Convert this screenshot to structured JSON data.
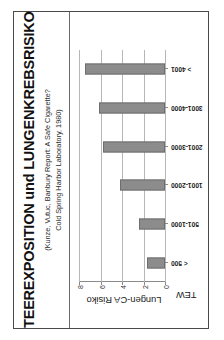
{
  "slide": {
    "title": "TEEREXPOSITION und LUNGENKREBSRISIKO",
    "subtitle_line1": "(Kunze, Vutuc, Banbury Report: A Safe Cigarette?",
    "subtitle_line2": "Cold Spring Harbor Laboratory, 1980)",
    "border_color": "#4a4a4a",
    "bar_color": "#8c8c8c",
    "grid_color": "#b6b6b6"
  },
  "chart_data": {
    "type": "bar",
    "title": "TEEREXPOSITION und LUNGENKREBSRISIKO",
    "categories": [
      "< 500",
      "501-1000",
      "1001-2000",
      "2001-3000",
      "3001-4000",
      "> 4001"
    ],
    "values": [
      1.7,
      2.4,
      4.15,
      5.8,
      6.1,
      7.4
    ],
    "xlabel": "TEW",
    "ylabel": "Lungen-CA Risiko",
    "ylim": [
      0,
      8
    ],
    "yticks": [
      0,
      2,
      4,
      6,
      8
    ],
    "ytick_labels": [
      "0",
      "2",
      "4",
      "6",
      "8"
    ],
    "grid": true,
    "legend": false,
    "series": [
      {
        "name": "Lungen-CA Risiko",
        "values": [
          1.7,
          2.4,
          4.15,
          5.8,
          6.1,
          7.4
        ]
      }
    ]
  }
}
